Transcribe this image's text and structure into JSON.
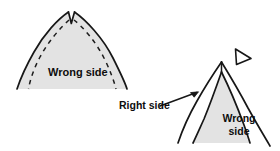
{
  "figure": {
    "background_color": "#ffffff",
    "outline_color": "#1a1a1a",
    "fill_color": "#e2e2e2",
    "text_color": "#0d0d0d"
  },
  "labels": {
    "wrong_side_left": "Wrong side",
    "right_side": "Right side",
    "wrong_side_right_line1": "Wrong",
    "wrong_side_right_line2": "side"
  },
  "shapes": {
    "left_arch": {
      "name": "wide-pointed-arch",
      "has_notch": true,
      "notch_label": "v-notch-at-apex",
      "dashed_guides": 2,
      "filled": true
    },
    "right_arch": {
      "name": "narrow-pointed-arch",
      "outer_outline": true,
      "inner_filled_triangle": true
    },
    "marker_triangle": {
      "name": "right-pointing-triangle-marker",
      "filled": false
    },
    "leader_line": {
      "name": "right-side-leader-arrow",
      "has_arrowhead": true
    }
  }
}
